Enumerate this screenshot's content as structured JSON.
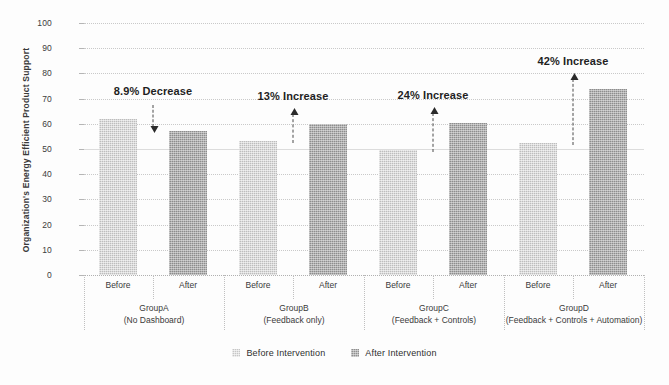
{
  "chart_data": {
    "type": "bar",
    "title": "",
    "xlabel": "",
    "ylabel": "Organization's Energy Efficient Product Support",
    "ylim": [
      0,
      100
    ],
    "ytick_labels": [
      "100",
      "90",
      "80",
      "70",
      "60",
      "50",
      "40",
      "30",
      "20",
      "10",
      "0"
    ],
    "ytick_values": [
      100,
      90,
      80,
      70,
      60,
      50,
      40,
      30,
      20,
      10,
      0
    ],
    "grid": true,
    "legend_position": "bottom-center",
    "categories": [
      "GroupA",
      "GroupB",
      "GroupC",
      "GroupD"
    ],
    "subcategories": [
      "Before",
      "After"
    ],
    "series": [
      {
        "name": "Before Intervention",
        "values": [
          62,
          53,
          49.5,
          52.5
        ],
        "color": "#bdbdbd"
      },
      {
        "name": "After Intervention",
        "values": [
          57,
          60,
          60.5,
          74
        ],
        "color": "#8d8d8d"
      }
    ],
    "groups": [
      {
        "name": "GroupA",
        "subtitle": "(No Dashboard)",
        "before_label": "Before",
        "after_label": "After",
        "before": 62,
        "after": 57,
        "annotation": "8.9% Decrease",
        "direction": "down"
      },
      {
        "name": "GroupB",
        "subtitle": "(Feedback only)",
        "before_label": "Before",
        "after_label": "After",
        "before": 53,
        "after": 60,
        "annotation": "13% Increase",
        "direction": "up"
      },
      {
        "name": "GroupC",
        "subtitle": "(Feedback + Controls)",
        "before_label": "Before",
        "after_label": "After",
        "before": 49.5,
        "after": 60.5,
        "annotation": "24% Increase",
        "direction": "up"
      },
      {
        "name": "GroupD",
        "subtitle": "(Feedback + Controls + Automation)",
        "before_label": "Before",
        "after_label": "After",
        "before": 52.5,
        "after": 74,
        "annotation": "42% Increase",
        "direction": "up"
      }
    ],
    "legend": [
      {
        "label": "Before Intervention",
        "swatch": "before"
      },
      {
        "label": "After Intervention",
        "swatch": "after"
      }
    ],
    "colors": {
      "before_bar": "#bdbdbd",
      "after_bar": "#8d8d8d",
      "gridline": "#c9c9c9",
      "text": "#2b2b2b",
      "background": "#ffffff"
    }
  }
}
